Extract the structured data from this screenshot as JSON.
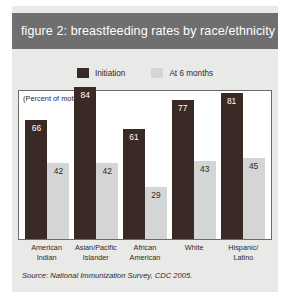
{
  "figure": {
    "title": "figure 2: breastfeeding rates by race/ethnicity",
    "axis_note": "(Percent of mothers)",
    "source": "Source: National Immunization Survey, CDC 2005.",
    "title_band_color": "#6e6f6e",
    "panel_color": "#e9e9e7"
  },
  "legend": {
    "items": [
      {
        "label": "Initiation",
        "color": "#3a2a26"
      },
      {
        "label": "At 6 months",
        "color": "#d4d6d5"
      }
    ]
  },
  "chart_data": {
    "type": "bar",
    "title": "figure 2: breastfeeding rates by race/ethnicity",
    "xlabel": "",
    "ylabel": "(Percent of mothers)",
    "ylim": [
      0,
      100
    ],
    "grid": false,
    "legend_position": "top-center",
    "annotations": [
      "(Percent of mothers)",
      "Source: National Immunization Survey, CDC 2005."
    ],
    "categories": [
      "American Indian",
      "Asian/Pacific Islander",
      "African American",
      "White",
      "Hispanic/ Latino"
    ],
    "category_lines": [
      [
        "American",
        "Indian"
      ],
      [
        "Asian/Pacific",
        "Islander"
      ],
      [
        "African",
        "American"
      ],
      [
        "White",
        ""
      ],
      [
        "Hispanic/",
        "Latino"
      ]
    ],
    "series": [
      {
        "name": "Initiation",
        "color": "#3a2a26",
        "values": [
          66,
          84,
          61,
          77,
          81
        ]
      },
      {
        "name": "At 6 months",
        "color": "#d4d6d5",
        "values": [
          42,
          42,
          29,
          43,
          45
        ]
      }
    ]
  }
}
